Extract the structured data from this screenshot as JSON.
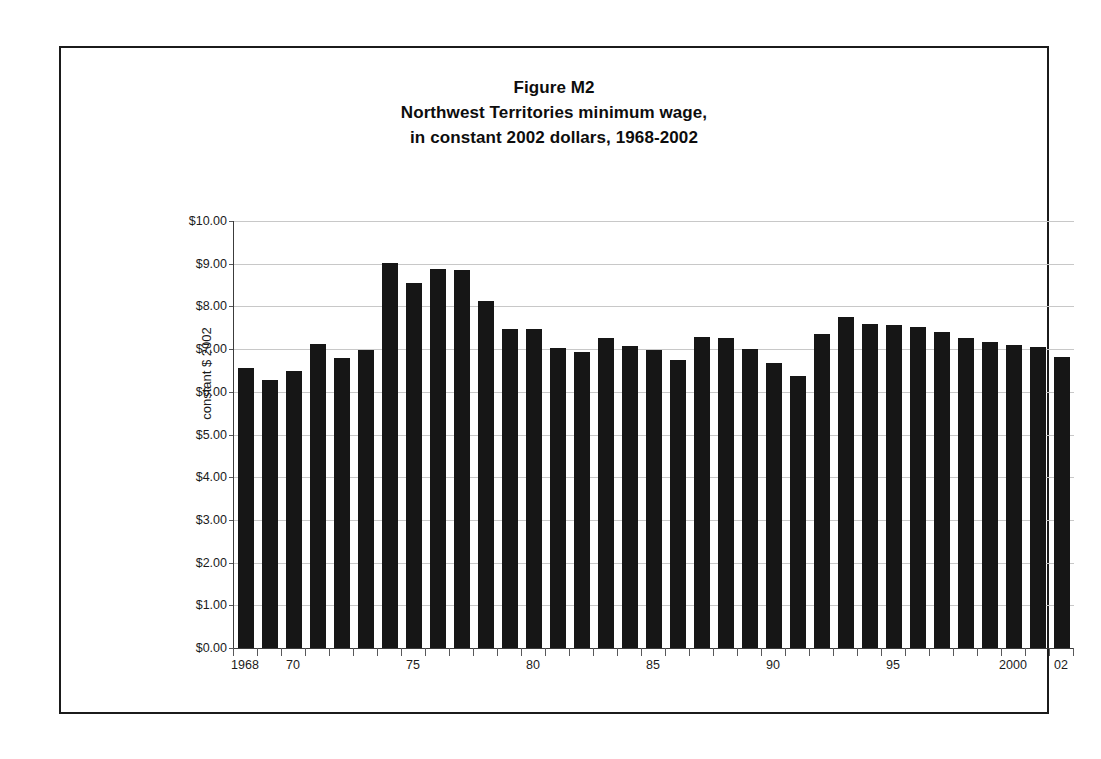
{
  "figure": {
    "title_lines": [
      "Figure M2",
      "Northwest Territories minimum wage,",
      "in constant 2002 dollars, 1968-2002"
    ],
    "border_color": "#1b1b1b"
  },
  "chart_data": {
    "type": "bar",
    "title": "Figure M2 Northwest Territories minimum wage, in constant 2002 dollars, 1968-2002",
    "xlabel": "",
    "ylabel": "constant $ 2002",
    "ylim": [
      0,
      10
    ],
    "ytick_step": 1,
    "grid": true,
    "legend": false,
    "bar_color": "#161616",
    "categories": [
      "1968",
      "1969",
      "1970",
      "1971",
      "1972",
      "1973",
      "1974",
      "1975",
      "1976",
      "1977",
      "1978",
      "1979",
      "1980",
      "1981",
      "1982",
      "1983",
      "1984",
      "1985",
      "1986",
      "1987",
      "1988",
      "1989",
      "1990",
      "1991",
      "1992",
      "1993",
      "1994",
      "1995",
      "1996",
      "1997",
      "1998",
      "1999",
      "2000",
      "2001",
      "2002"
    ],
    "values": [
      6.56,
      6.27,
      6.48,
      7.12,
      6.79,
      6.99,
      9.02,
      8.54,
      8.88,
      8.85,
      8.13,
      7.46,
      7.47,
      7.03,
      6.93,
      7.26,
      7.08,
      6.99,
      6.74,
      7.29,
      7.25,
      7.0,
      6.67,
      6.36,
      7.35,
      7.75,
      7.58,
      7.57,
      7.52,
      7.4,
      7.27,
      7.17,
      7.1,
      7.05,
      6.82
    ],
    "ytick_labels": [
      "$0.00",
      "$1.00",
      "$2.00",
      "$3.00",
      "$4.00",
      "$5.00",
      "$6.00",
      "$7.00",
      "$8.00",
      "$9.00",
      "$10.00"
    ],
    "xtick_labels": [
      {
        "label": "1968",
        "index": 0
      },
      {
        "label": "70",
        "index": 2
      },
      {
        "label": "75",
        "index": 7
      },
      {
        "label": "80",
        "index": 12
      },
      {
        "label": "85",
        "index": 17
      },
      {
        "label": "90",
        "index": 22
      },
      {
        "label": "95",
        "index": 27
      },
      {
        "label": "2000",
        "index": 32
      },
      {
        "label": "02",
        "index": 34
      }
    ]
  }
}
